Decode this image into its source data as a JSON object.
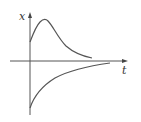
{
  "diagram": {
    "axes": {
      "vertical_label": "x",
      "horizontal_label": "t"
    },
    "curves": [
      {
        "name": "upper-curve",
        "description": "starts positive, rises to a peak, then decays toward t-axis"
      },
      {
        "name": "lower-curve",
        "description": "starts negative, monotonically approaches t-axis from below"
      }
    ],
    "colors": {
      "stroke": "#555555",
      "background": "#ffffff"
    }
  }
}
